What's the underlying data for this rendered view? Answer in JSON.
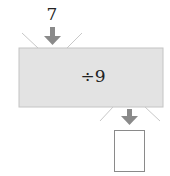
{
  "diagram": {
    "type": "function-machine",
    "input": "7",
    "operation": "÷9",
    "output": "",
    "colors": {
      "machine_fill": "#e3e3e3",
      "machine_border": "#bdbdbd",
      "arrow": "#8a8a8a",
      "funnel_lines": "#c8c8c8",
      "output_box_border": "#8a8a8a"
    }
  }
}
